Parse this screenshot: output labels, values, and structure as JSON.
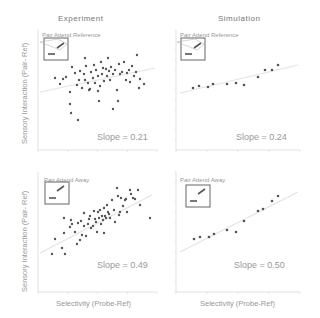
{
  "figure": {
    "columns": [
      "Experiment",
      "Simulation"
    ],
    "ylabel": "Sensory Interaction (Pair- Ref)",
    "xlabel": "Selectivity (Probe-Ref)"
  },
  "chart_data": [
    {
      "type": "scatter",
      "column": "Experiment",
      "panel_label": "Pair Attend Reference",
      "slope_text": "Slope = 0.21",
      "slope": 0.21,
      "grid": false,
      "points_px": [
        [
          55,
          78
        ],
        [
          63,
          79
        ],
        [
          60,
          84
        ],
        [
          66,
          77
        ],
        [
          70,
          92
        ],
        [
          72,
          67
        ],
        [
          75,
          73
        ],
        [
          77,
          85
        ],
        [
          79,
          80
        ],
        [
          80,
          71
        ],
        [
          82,
          88
        ],
        [
          84,
          74
        ],
        [
          85,
          80
        ],
        [
          86,
          66
        ],
        [
          88,
          83
        ],
        [
          90,
          89
        ],
        [
          91,
          72
        ],
        [
          93,
          78
        ],
        [
          94,
          65
        ],
        [
          95,
          83
        ],
        [
          96,
          70
        ],
        [
          98,
          76
        ],
        [
          100,
          86
        ],
        [
          101,
          62
        ],
        [
          102,
          74
        ],
        [
          103,
          68
        ],
        [
          104,
          81
        ],
        [
          106,
          69
        ],
        [
          107,
          76
        ],
        [
          108,
          58
        ],
        [
          109,
          71
        ],
        [
          110,
          80
        ],
        [
          111,
          67
        ],
        [
          113,
          74
        ],
        [
          115,
          70
        ],
        [
          117,
          90
        ],
        [
          118,
          101
        ],
        [
          119,
          64
        ],
        [
          120,
          74
        ],
        [
          122,
          72
        ],
        [
          124,
          62
        ],
        [
          126,
          80
        ],
        [
          127,
          73
        ],
        [
          129,
          70
        ],
        [
          130,
          82
        ],
        [
          132,
          66
        ],
        [
          134,
          76
        ],
        [
          136,
          72
        ],
        [
          137,
          55
        ],
        [
          139,
          88
        ],
        [
          140,
          79
        ],
        [
          144,
          84
        ],
        [
          70,
          104
        ],
        [
          71,
          113
        ],
        [
          78,
          120
        ],
        [
          99,
          101
        ],
        [
          113,
          109
        ],
        [
          85,
          58
        ],
        [
          89,
          90
        ],
        [
          98,
          91
        ]
      ],
      "fit_px": [
        [
          40,
          92
        ],
        [
          155,
          68
        ]
      ]
    },
    {
      "type": "scatter",
      "column": "Simulation",
      "panel_label": "Pair Attend Reference",
      "slope_text": "Slope = 0.24",
      "slope": 0.24,
      "grid": false,
      "x_ticks": [
        "",
        "0.5",
        "",
        "0.5",
        ""
      ],
      "points_px": [
        [
          193,
          88
        ],
        [
          199,
          86
        ],
        [
          208,
          87
        ],
        [
          213,
          84
        ],
        [
          227,
          84
        ],
        [
          236,
          83
        ],
        [
          244,
          85
        ],
        [
          258,
          77
        ],
        [
          265,
          70
        ],
        [
          272,
          70
        ],
        [
          278,
          65
        ]
      ],
      "fit_px": [
        [
          180,
          93
        ],
        [
          298,
          65
        ]
      ]
    },
    {
      "type": "scatter",
      "column": "Experiment",
      "panel_label": "Pair Attend Away",
      "slope_text": "Slope = 0.49",
      "slope": 0.49,
      "grid": false,
      "points_px": [
        [
          52,
          254
        ],
        [
          55,
          239
        ],
        [
          62,
          248
        ],
        [
          64,
          218
        ],
        [
          65,
          254
        ],
        [
          70,
          227
        ],
        [
          71,
          220
        ],
        [
          72,
          224
        ],
        [
          75,
          232
        ],
        [
          77,
          244
        ],
        [
          78,
          223
        ],
        [
          80,
          240
        ],
        [
          81,
          221
        ],
        [
          82,
          235
        ],
        [
          84,
          226
        ],
        [
          84,
          213
        ],
        [
          86,
          236
        ],
        [
          88,
          224
        ],
        [
          89,
          219
        ],
        [
          90,
          216
        ],
        [
          91,
          228
        ],
        [
          93,
          226
        ],
        [
          94,
          211
        ],
        [
          95,
          219
        ],
        [
          96,
          222
        ],
        [
          97,
          232
        ],
        [
          98,
          212
        ],
        [
          99,
          218
        ],
        [
          100,
          210
        ],
        [
          101,
          224
        ],
        [
          102,
          216
        ],
        [
          103,
          220
        ],
        [
          104,
          208
        ],
        [
          105,
          216
        ],
        [
          106,
          218
        ],
        [
          107,
          205
        ],
        [
          108,
          212
        ],
        [
          109,
          214
        ],
        [
          110,
          218
        ],
        [
          112,
          200
        ],
        [
          114,
          210
        ],
        [
          115,
          222
        ],
        [
          117,
          188
        ],
        [
          118,
          196
        ],
        [
          119,
          215
        ],
        [
          120,
          212
        ],
        [
          121,
          198
        ],
        [
          123,
          206
        ],
        [
          125,
          200
        ],
        [
          126,
          199
        ],
        [
          127,
          212
        ],
        [
          130,
          190
        ],
        [
          131,
          194
        ],
        [
          133,
          198
        ],
        [
          135,
          199
        ],
        [
          138,
          190
        ],
        [
          140,
          205
        ],
        [
          150,
          218
        ],
        [
          104,
          233
        ],
        [
          64,
          233
        ]
      ],
      "fit_px": [
        [
          40,
          253
        ],
        [
          152,
          195
        ]
      ]
    },
    {
      "type": "scatter",
      "column": "Simulation",
      "panel_label": "Pair Attend Away",
      "slope_text": "Slope = 0.50",
      "slope": 0.5,
      "grid": false,
      "points_px": [
        [
          194,
          239
        ],
        [
          200,
          237
        ],
        [
          209,
          237
        ],
        [
          214,
          234
        ],
        [
          227,
          230
        ],
        [
          236,
          232
        ],
        [
          244,
          221
        ],
        [
          258,
          211
        ],
        [
          263,
          209
        ],
        [
          272,
          201
        ],
        [
          278,
          196
        ]
      ],
      "fit_px": [
        [
          180,
          252
        ],
        [
          298,
          192
        ]
      ]
    }
  ]
}
